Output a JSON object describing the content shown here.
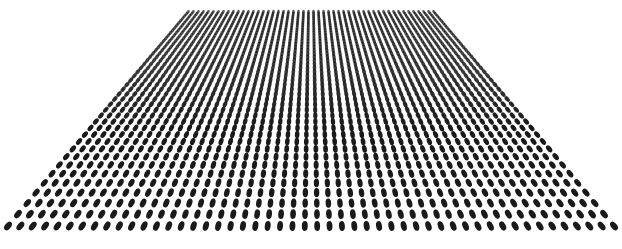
{
  "image": {
    "subject": "perspective dot grid",
    "width": 622,
    "height": 249,
    "background_color": "#ffffff",
    "dot_color": "#1a1a1a"
  },
  "grid": {
    "columns": 50,
    "rows": 44,
    "top_edge": {
      "y": 12,
      "x_left": 186,
      "x_right": 432
    },
    "bottom_edge": {
      "y": 226,
      "x_left": 8,
      "x_right": 614
    },
    "dot_rx_bottom": 2.6,
    "dot_ry_bottom": 4.6
  }
}
